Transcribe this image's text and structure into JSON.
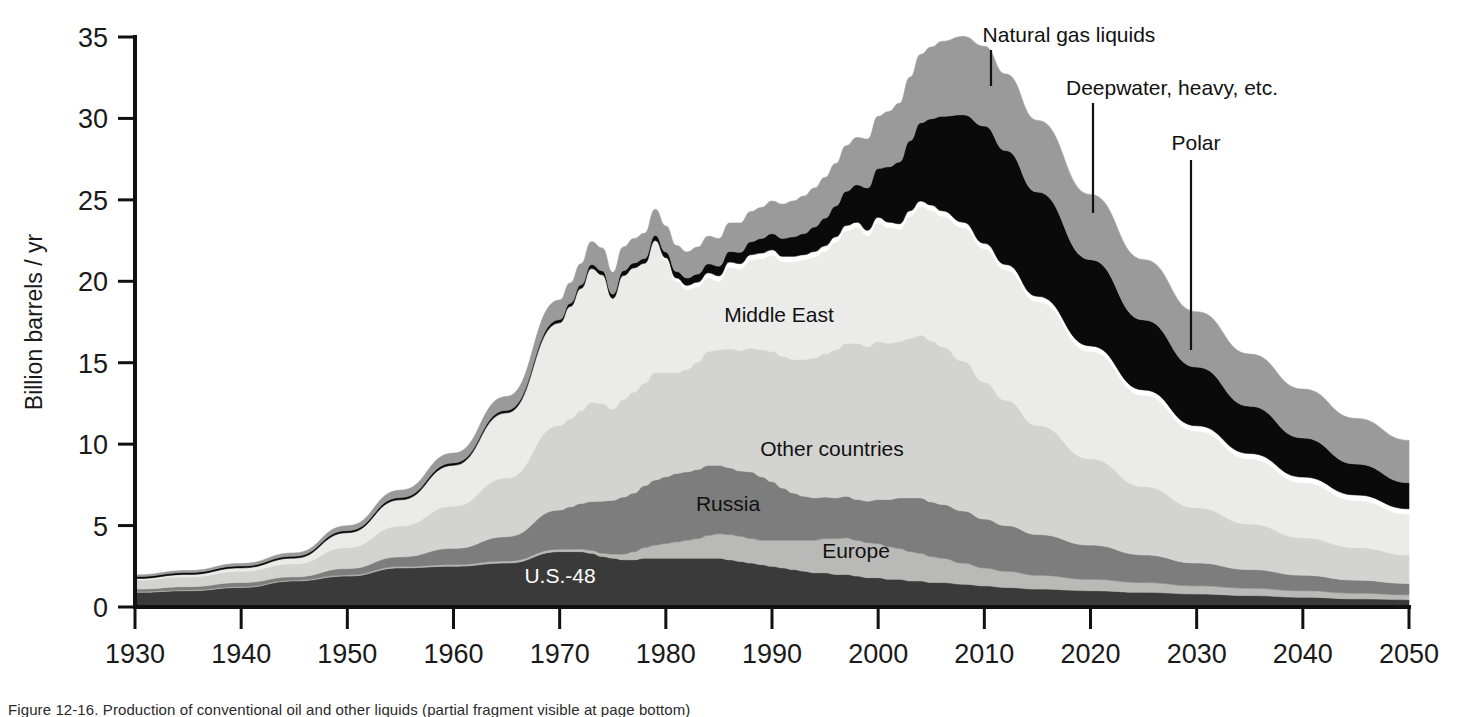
{
  "chart_data": {
    "type": "area",
    "title": "",
    "xlabel": "",
    "ylabel": "Billion barrels / yr",
    "xlim": [
      1930,
      2050
    ],
    "ylim": [
      0,
      35
    ],
    "grid": false,
    "legend_position": "inline-labels",
    "xticks": [
      1930,
      1940,
      1950,
      1960,
      1970,
      1980,
      1990,
      2000,
      2010,
      2020,
      2030,
      2040,
      2050
    ],
    "yticks": [
      0,
      5,
      10,
      15,
      20,
      25,
      30,
      35
    ],
    "stacking": "bottom-to-top",
    "x": [
      1930,
      1935,
      1940,
      1945,
      1950,
      1955,
      1960,
      1965,
      1970,
      1971,
      1972,
      1973,
      1974,
      1975,
      1976,
      1977,
      1978,
      1979,
      1980,
      1981,
      1982,
      1983,
      1984,
      1985,
      1986,
      1987,
      1988,
      1989,
      1990,
      1991,
      1992,
      1993,
      1994,
      1995,
      1996,
      1997,
      1998,
      1999,
      2000,
      2001,
      2002,
      2003,
      2004,
      2005,
      2006,
      2008,
      2010,
      2012,
      2015,
      2020,
      2025,
      2030,
      2035,
      2040,
      2045,
      2050
    ],
    "series": [
      {
        "name": "U.S.-48",
        "color": "#3a3a3a",
        "values": [
          0.9,
          1.0,
          1.2,
          1.6,
          1.9,
          2.4,
          2.5,
          2.7,
          3.4,
          3.4,
          3.4,
          3.3,
          3.1,
          3.0,
          2.9,
          2.9,
          3.0,
          3.0,
          3.0,
          3.0,
          3.0,
          3.0,
          3.0,
          3.0,
          2.9,
          2.8,
          2.7,
          2.6,
          2.5,
          2.4,
          2.3,
          2.2,
          2.1,
          2.1,
          2.0,
          2.0,
          1.9,
          1.8,
          1.8,
          1.7,
          1.7,
          1.6,
          1.6,
          1.5,
          1.5,
          1.4,
          1.3,
          1.2,
          1.1,
          1.0,
          0.9,
          0.8,
          0.7,
          0.6,
          0.5,
          0.45
        ]
      },
      {
        "name": "Europe",
        "color": "#b9b9b7",
        "values": [
          0.05,
          0.05,
          0.05,
          0.05,
          0.06,
          0.08,
          0.1,
          0.12,
          0.15,
          0.15,
          0.16,
          0.18,
          0.2,
          0.25,
          0.35,
          0.5,
          0.65,
          0.8,
          0.9,
          1.0,
          1.1,
          1.2,
          1.4,
          1.5,
          1.55,
          1.55,
          1.5,
          1.5,
          1.6,
          1.7,
          1.8,
          1.9,
          2.0,
          2.1,
          2.2,
          2.25,
          2.2,
          2.15,
          2.1,
          2.0,
          1.9,
          1.8,
          1.7,
          1.6,
          1.5,
          1.3,
          1.1,
          1.0,
          0.85,
          0.7,
          0.6,
          0.5,
          0.45,
          0.4,
          0.35,
          0.3
        ]
      },
      {
        "name": "Russia",
        "color": "#7d7d7d",
        "values": [
          0.15,
          0.2,
          0.25,
          0.2,
          0.4,
          0.6,
          1.0,
          1.5,
          2.4,
          2.6,
          2.8,
          3.0,
          3.2,
          3.3,
          3.5,
          3.6,
          3.8,
          4.0,
          4.1,
          4.2,
          4.2,
          4.25,
          4.3,
          4.2,
          4.1,
          4.0,
          4.1,
          3.9,
          3.6,
          3.2,
          2.9,
          2.7,
          2.6,
          2.55,
          2.5,
          2.55,
          2.5,
          2.55,
          2.7,
          2.9,
          3.1,
          3.3,
          3.4,
          3.35,
          3.3,
          3.2,
          3.0,
          2.8,
          2.5,
          2.1,
          1.7,
          1.4,
          1.15,
          0.95,
          0.8,
          0.7
        ]
      },
      {
        "name": "Other countries",
        "color": "#d3d3d1",
        "values": [
          0.55,
          0.6,
          0.7,
          0.8,
          1.3,
          1.9,
          2.6,
          3.6,
          5.2,
          5.4,
          5.7,
          6.1,
          6.0,
          5.6,
          6.0,
          6.2,
          6.3,
          6.6,
          6.4,
          6.2,
          6.3,
          6.6,
          7.0,
          7.1,
          7.3,
          7.4,
          7.6,
          7.8,
          8.0,
          8.1,
          8.2,
          8.4,
          8.6,
          8.8,
          9.1,
          9.4,
          9.6,
          9.5,
          9.7,
          9.6,
          9.6,
          9.8,
          10.0,
          9.9,
          9.7,
          9.2,
          8.4,
          7.7,
          6.7,
          5.3,
          4.2,
          3.4,
          2.8,
          2.3,
          2.0,
          1.75
        ]
      },
      {
        "name": "Middle East",
        "color": "#ebebe9",
        "values": [
          0.1,
          0.15,
          0.2,
          0.35,
          0.9,
          1.6,
          2.5,
          4.0,
          6.3,
          6.9,
          7.5,
          8.2,
          7.9,
          6.8,
          7.6,
          7.6,
          7.3,
          8.0,
          6.9,
          5.6,
          4.9,
          4.6,
          4.5,
          4.2,
          5.0,
          5.0,
          5.4,
          5.6,
          5.9,
          5.8,
          6.0,
          6.1,
          6.2,
          6.3,
          6.6,
          6.9,
          7.1,
          6.8,
          7.3,
          7.1,
          6.9,
          7.5,
          7.9,
          8.0,
          8.0,
          8.2,
          8.2,
          8.0,
          7.6,
          6.6,
          5.6,
          4.7,
          4.0,
          3.4,
          2.9,
          2.5
        ]
      },
      {
        "name": "Polar",
        "color": "#ffffff",
        "values": [
          0,
          0,
          0,
          0,
          0,
          0,
          0,
          0,
          0,
          0,
          0,
          0,
          0,
          0,
          0,
          0.02,
          0.05,
          0.1,
          0.15,
          0.2,
          0.25,
          0.3,
          0.32,
          0.33,
          0.33,
          0.33,
          0.33,
          0.33,
          0.33,
          0.33,
          0.33,
          0.33,
          0.33,
          0.33,
          0.33,
          0.33,
          0.33,
          0.33,
          0.33,
          0.33,
          0.33,
          0.33,
          0.33,
          0.33,
          0.33,
          0.33,
          0.33,
          0.33,
          0.33,
          0.33,
          0.33,
          0.33,
          0.33,
          0.33,
          0.33,
          0.33
        ]
      },
      {
        "name": "Deepwater, heavy, etc.",
        "color": "#0a0a0a",
        "values": [
          0.12,
          0.12,
          0.12,
          0.12,
          0.13,
          0.14,
          0.15,
          0.16,
          0.2,
          0.2,
          0.22,
          0.25,
          0.25,
          0.25,
          0.3,
          0.3,
          0.3,
          0.32,
          0.35,
          0.4,
          0.45,
          0.5,
          0.55,
          0.6,
          0.65,
          0.7,
          0.8,
          0.9,
          1.0,
          1.1,
          1.2,
          1.3,
          1.5,
          1.7,
          1.9,
          2.1,
          2.3,
          2.6,
          3.0,
          3.4,
          3.8,
          4.3,
          4.8,
          5.3,
          5.8,
          6.6,
          7.2,
          7.0,
          6.4,
          5.3,
          4.3,
          3.6,
          2.9,
          2.4,
          1.9,
          1.6
        ]
      },
      {
        "name": "Natural gas liquids",
        "color": "#9a9a9a",
        "values": [
          0.1,
          0.12,
          0.15,
          0.2,
          0.3,
          0.45,
          0.6,
          0.85,
          1.2,
          1.25,
          1.3,
          1.4,
          1.4,
          1.35,
          1.45,
          1.5,
          1.55,
          1.6,
          1.6,
          1.6,
          1.6,
          1.65,
          1.7,
          1.7,
          1.75,
          1.8,
          1.85,
          1.9,
          2.0,
          2.1,
          2.2,
          2.3,
          2.4,
          2.5,
          2.6,
          2.8,
          2.9,
          3.0,
          3.2,
          3.4,
          3.6,
          3.9,
          4.2,
          4.4,
          4.6,
          4.8,
          4.9,
          4.7,
          4.4,
          4.0,
          3.7,
          3.4,
          3.2,
          3.0,
          2.8,
          2.6
        ]
      }
    ],
    "annotations": [
      {
        "text": "Natural gas liquids",
        "x_px": 1069,
        "y_px": 42,
        "leader_x": 991,
        "leader_y1": 50,
        "leader_y2": 86
      },
      {
        "text": "Deepwater, heavy, etc.",
        "x_px": 1172,
        "y_px": 95,
        "leader_x": 1093,
        "leader_y1": 103,
        "leader_y2": 213
      },
      {
        "text": "Polar",
        "x_px": 1196,
        "y_px": 150,
        "leader_x": 1191,
        "leader_y1": 160,
        "leader_y2": 350
      }
    ],
    "inline_labels": [
      {
        "text": "Middle East",
        "x_px": 779,
        "y_px": 322,
        "light": false
      },
      {
        "text": "Other countries",
        "x_px": 832,
        "y_px": 456,
        "light": false
      },
      {
        "text": "Russia",
        "x_px": 728,
        "y_px": 511,
        "light": false
      },
      {
        "text": "Europe",
        "x_px": 856,
        "y_px": 558,
        "light": false
      },
      {
        "text": "U.S.-48",
        "x_px": 560,
        "y_px": 583,
        "light": true
      }
    ]
  },
  "axes": {
    "y_axis_title": "Billion barrels / yr",
    "x_tick_labels": [
      "1930",
      "1940",
      "1950",
      "1960",
      "1970",
      "1980",
      "1990",
      "2000",
      "2010",
      "2020",
      "2030",
      "2040",
      "2050"
    ],
    "y_tick_labels": [
      "0",
      "5",
      "10",
      "15",
      "20",
      "25",
      "30",
      "35"
    ]
  },
  "colors": {
    "us48": "#3a3a3a",
    "europe": "#b9b9b7",
    "russia": "#7d7d7d",
    "other": "#d3d3d1",
    "middle_east": "#ebebe9",
    "polar": "#ffffff",
    "deepwater": "#0a0a0a",
    "ngl": "#9a9a9a",
    "axis": "#111111"
  },
  "caption": {
    "text": "Figure 12-16. Production of conventional oil and other liquids (partial fragment visible at page bottom)"
  }
}
